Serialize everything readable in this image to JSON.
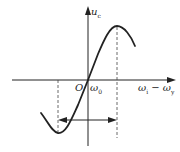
{
  "diagram": {
    "type": "frequency discriminator characteristic curve",
    "colors": {
      "stroke": "#222222",
      "background": "#ffffff"
    },
    "axes": {
      "y_label_main": "u",
      "y_label_sub": "c",
      "x_label_main_1": "ω",
      "x_label_sub_1": "i",
      "x_label_minus": " − ",
      "x_label_main_2": "ω",
      "x_label_sub_2": "y"
    },
    "origin_label": "O",
    "center_label_main": "ω",
    "center_label_sub": "0",
    "annotations": {
      "dashed_lines": [
        "left extremum (minimum)",
        "right extremum (maximum)"
      ],
      "double_arrow": "linear range between extrema"
    }
  }
}
